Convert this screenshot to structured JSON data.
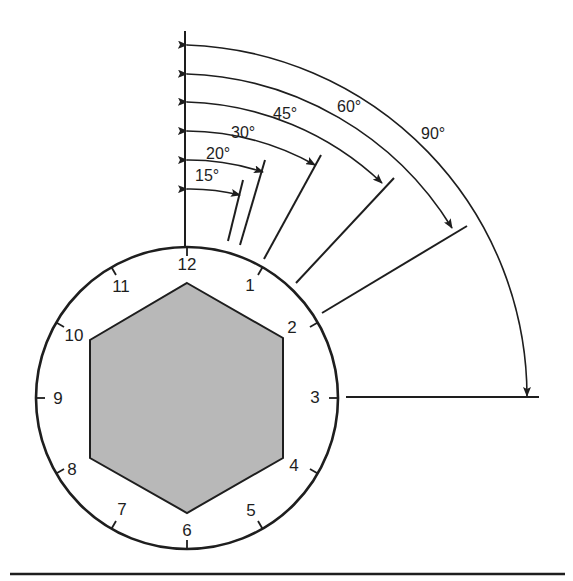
{
  "figure": {
    "colors": {
      "ink": "#1e1e1e",
      "hex_fill": "#b8b8b8",
      "background": "#ffffff"
    }
  },
  "clock": {
    "center": [
      187,
      398
    ],
    "radius": 151,
    "numbers": [
      "12",
      "1",
      "2",
      "3",
      "4",
      "5",
      "6",
      "7",
      "8",
      "9",
      "10",
      "11"
    ]
  },
  "hexagon": {
    "points": [
      [
        187,
        283
      ],
      [
        283,
        338
      ],
      [
        283,
        458
      ],
      [
        187,
        513
      ],
      [
        90,
        458
      ],
      [
        90,
        340
      ]
    ]
  },
  "angles": [
    {
      "label": "15°",
      "degrees": 15,
      "label_pos": [
        195,
        181
      ]
    },
    {
      "label": "20°",
      "degrees": 20,
      "label_pos": [
        206,
        159
      ]
    },
    {
      "label": "30°",
      "degrees": 30,
      "label_pos": [
        231,
        138
      ]
    },
    {
      "label": "45°",
      "degrees": 45,
      "label_pos": [
        287,
        119
      ]
    },
    {
      "label": "60°",
      "degrees": 60,
      "label_pos": [
        337,
        112
      ]
    },
    {
      "label": "90°",
      "degrees": 90,
      "label_pos": [
        421,
        139
      ]
    }
  ]
}
